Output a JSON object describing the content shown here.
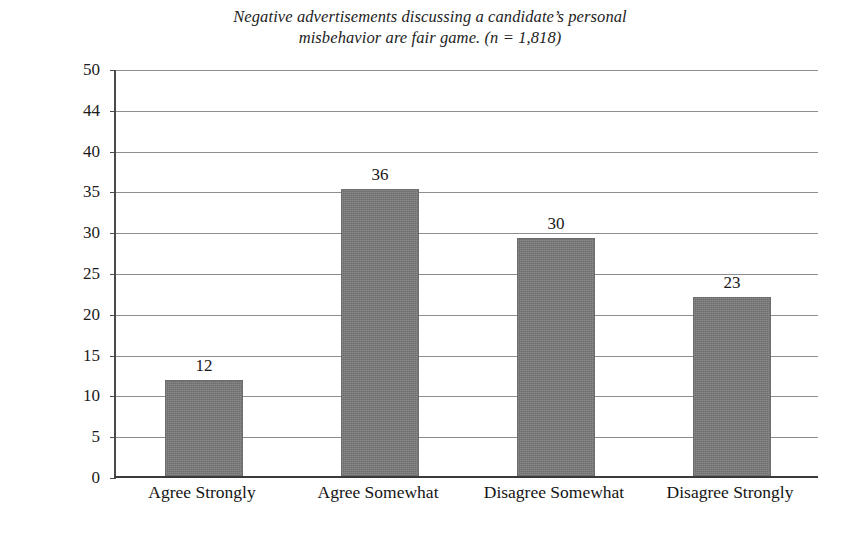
{
  "chart_data": {
    "type": "bar",
    "title_lines": [
      "Negative advertisements discussing a candidate’s personal",
      "misbehavior are fair game. (n = 1,818)"
    ],
    "xlabel": "",
    "ylabel": "Percentage",
    "categories": [
      "Agree Strongly",
      "Agree Somewhat",
      "Disagree Somewhat",
      "Disagree Strongly"
    ],
    "values": [
      12,
      36,
      30,
      23
    ],
    "value_labels": [
      "12",
      "36",
      "30",
      "23"
    ],
    "plotted_heights": [
      11.8,
      35.2,
      29.2,
      21.9
    ],
    "ylim": [
      0,
      50
    ],
    "ytick_labels": [
      "50",
      "44",
      "40",
      "35",
      "30",
      "25",
      "20",
      "15",
      "10",
      "5",
      "0"
    ],
    "ytick_positions": [
      50,
      45,
      40,
      35,
      30,
      25,
      20,
      15,
      10,
      5,
      0
    ],
    "grid": true,
    "grid_axis": "y",
    "legend": null,
    "legend_position": "none",
    "bar_color": "#787878",
    "bar_edge_color": "#6d6d6d",
    "axis_color": "#3a3a3a",
    "grid_color": "#8d8d8d",
    "background_color": "#ffffff",
    "text_color": "#1b1b1b",
    "n": "1,818"
  }
}
